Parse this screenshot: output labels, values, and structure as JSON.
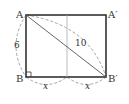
{
  "diagram": {
    "type": "geometry-figure",
    "points": {
      "A": {
        "label": "A",
        "x": 26,
        "y": 15
      },
      "A_prime": {
        "label": "A′",
        "x": 106,
        "y": 15
      },
      "B": {
        "label": "B",
        "x": 26,
        "y": 77
      },
      "B_prime": {
        "label": "B′",
        "x": 106,
        "y": 77
      }
    },
    "measures": {
      "side_AB": "6",
      "diagonal_AB_prime": "10",
      "base_left": "x",
      "base_right": "x"
    },
    "colors": {
      "rect_stroke": "#333333",
      "fold_line": "#aaaaaa",
      "diagonal": "#555555",
      "dashed": "#999999"
    }
  }
}
